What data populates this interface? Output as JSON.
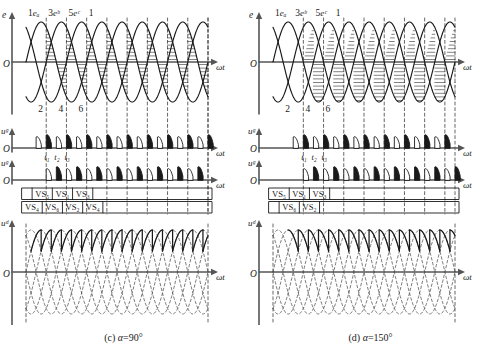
{
  "figure": {
    "type": "three-phase-bridge-rectifier-timing-diagram",
    "panels": [
      {
        "id": "c",
        "caption": "(c) α=90°",
        "caption_label": "(c)",
        "alpha_symbol": "α",
        "alpha_value": "=90°",
        "firing_angle_deg": 90,
        "rows": [
          {
            "name": "emf-row",
            "y_axis_label": "e",
            "x_axis_label": "ωt",
            "origin_label": "O",
            "phase_labels": [
              "eₐ",
              "eᵇ",
              "eᶜ"
            ],
            "phase_label_plain": [
              "ea",
              "eb",
              "ec"
            ],
            "crossing_numbers": [
              "1",
              "3",
              "5",
              "1",
              "2",
              "4",
              "6"
            ],
            "top_numbers": [
              "1",
              "3",
              "5",
              "1"
            ],
            "bottom_numbers": [
              "2",
              "4",
              "6"
            ]
          },
          {
            "name": "gate-upper-row",
            "y_axis_label": "uᵍ",
            "y_axis_plain": "ug",
            "x_axis_label": "ωt",
            "origin_label": "O",
            "time_marks": [
              "t₁",
              "t₂",
              "t₃"
            ],
            "time_marks_plain": [
              "t1",
              "t2",
              "t3"
            ]
          },
          {
            "name": "gate-lower-row",
            "y_axis_label": "uᵍ",
            "y_axis_plain": "ug",
            "x_axis_label": "ωt",
            "origin_label": "O"
          },
          {
            "name": "conduction-table",
            "upper_devices": [
              "VS₅",
              "VS₁",
              "VS₃"
            ],
            "upper_devices_plain": [
              "VS5",
              "VS1",
              "VS3"
            ],
            "lower_devices": [
              "VS₄",
              "VS₆",
              "VS₂",
              "VS₄"
            ],
            "lower_devices_plain": [
              "VS4",
              "VS6",
              "VS2",
              "VS4"
            ]
          },
          {
            "name": "output-voltage-row",
            "y_axis_label": "uᵈ",
            "y_axis_plain": "ud",
            "x_axis_label": "ωt",
            "origin_label": "O"
          }
        ]
      },
      {
        "id": "d",
        "caption": "(d) α=150°",
        "caption_label": "(d)",
        "alpha_symbol": "α",
        "alpha_value": "=150°",
        "firing_angle_deg": 150,
        "rows": [
          {
            "name": "emf-row",
            "y_axis_label": "e",
            "x_axis_label": "ωt",
            "origin_label": "O",
            "phase_labels": [
              "eₐ",
              "eᵇ",
              "eᶜ"
            ],
            "phase_label_plain": [
              "ea",
              "eb",
              "ec"
            ],
            "top_numbers": [
              "1",
              "3",
              "5",
              "1"
            ],
            "bottom_numbers": [
              "2",
              "4",
              "6"
            ]
          },
          {
            "name": "gate-upper-row",
            "y_axis_label": "uᵍ",
            "y_axis_plain": "ug",
            "x_axis_label": "ωt",
            "origin_label": "O",
            "time_marks": [
              "t₁",
              "t₂",
              "t₃"
            ],
            "time_marks_plain": [
              "t1",
              "t2",
              "t3"
            ]
          },
          {
            "name": "gate-lower-row",
            "y_axis_label": "uᵍ",
            "y_axis_plain": "ug",
            "x_axis_label": "ωt",
            "origin_label": "O"
          },
          {
            "name": "conduction-table",
            "upper_devices": [
              "VS₅",
              "VS₁",
              "VS₃"
            ],
            "upper_devices_plain": [
              "VS5",
              "VS1",
              "VS3"
            ],
            "lower_devices": [
              "VS₆",
              "VS₂"
            ],
            "lower_devices_plain": [
              "VS6",
              "VS2"
            ]
          },
          {
            "name": "output-voltage-row",
            "y_axis_label": "uᵈ",
            "y_axis_plain": "ud",
            "x_axis_label": "ωt",
            "origin_label": "O"
          }
        ]
      }
    ]
  },
  "chart_data": {
    "type": "line",
    "xlabel": "ωt",
    "ylabel": "e, uᵍ, uᵈ",
    "grid": false,
    "legend": [
      "eₐ",
      "eᵇ",
      "eᶜ"
    ],
    "x_cycles": 3,
    "series": [
      {
        "name": "eₐ",
        "phase_deg": 0,
        "amplitude": 1
      },
      {
        "name": "eᵇ",
        "phase_deg": 120,
        "amplitude": 1
      },
      {
        "name": "eᶜ",
        "phase_deg": 240,
        "amplitude": 1
      }
    ],
    "panels": [
      {
        "id": "c",
        "alpha_deg": 90,
        "ud_mean": 0.0,
        "note": "output sawtooth symmetric about zero, average zero"
      },
      {
        "id": "d",
        "alpha_deg": 150,
        "ud_mean": -1.2,
        "note": "inverter mode, output mostly negative, limited by commutation"
      }
    ]
  },
  "colors": {
    "ink": "#1a1a1a",
    "axis": "#555555",
    "dashed": "#4d4d4d",
    "background": "#ffffff"
  }
}
